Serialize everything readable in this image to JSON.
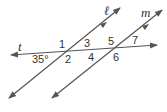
{
  "diagram": {
    "type": "parallel-lines-cut-by-transversal",
    "line_color": "#555555",
    "text_color": "#333333",
    "lines": {
      "transversal": {
        "label": "t"
      },
      "line_l": {
        "label": "ℓ",
        "parallel_mark": true
      },
      "line_m": {
        "label": "m",
        "parallel_mark": true
      }
    },
    "angles": [
      {
        "id": "1",
        "label": "1"
      },
      {
        "id": "2",
        "label": "2"
      },
      {
        "id": "3",
        "label": "3"
      },
      {
        "id": "4",
        "label": "4"
      },
      {
        "id": "5",
        "label": "5"
      },
      {
        "id": "6",
        "label": "6"
      },
      {
        "id": "7",
        "label": "7"
      },
      {
        "id": "given",
        "label": "35°"
      }
    ]
  }
}
